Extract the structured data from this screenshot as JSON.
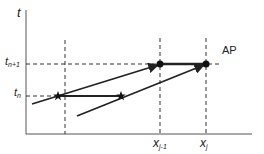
{
  "diagram": {
    "axis_labels": {
      "y": "t",
      "x_ticks": [
        {
          "base": "x",
          "sub": "j-1"
        },
        {
          "base": "x",
          "sub": "j"
        }
      ],
      "y_ticks": [
        {
          "base": "t",
          "sub": "n+1"
        },
        {
          "base": "t",
          "sub": "n"
        }
      ]
    },
    "annotation": "AP",
    "markers": {
      "stars": [
        "star-at-tn-left",
        "star-at-tn-right"
      ],
      "dots": [
        "dot-at-xj-1-tn1",
        "dot-at-xj-tn1"
      ]
    },
    "colors": {
      "axis": "#555555",
      "line": "#222222",
      "dashed": "#333333"
    }
  }
}
